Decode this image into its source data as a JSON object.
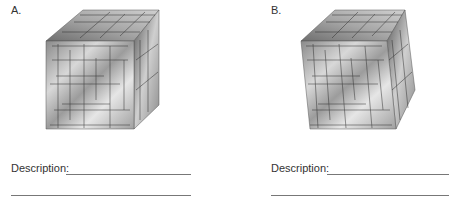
{
  "panels": [
    {
      "id": "A",
      "label": "A.",
      "description_label": "Description:",
      "cube": {
        "variant": "regular",
        "front": [
          [
            46,
            41
          ],
          [
            134,
            41
          ],
          [
            134,
            129
          ],
          [
            46,
            129
          ]
        ],
        "top": [
          [
            46,
            41
          ],
          [
            83,
            10
          ],
          [
            159,
            10
          ],
          [
            134,
            41
          ]
        ],
        "right": [
          [
            134,
            41
          ],
          [
            159,
            10
          ],
          [
            159,
            105
          ],
          [
            134,
            129
          ]
        ]
      }
    },
    {
      "id": "B",
      "label": "B.",
      "description_label": "Description:",
      "cube": {
        "variant": "distorted",
        "front": [
          [
            301,
            41
          ],
          [
            387,
            41
          ],
          [
            396,
            129
          ],
          [
            310,
            129
          ]
        ],
        "top": [
          [
            301,
            41
          ],
          [
            335,
            10
          ],
          [
            405,
            10
          ],
          [
            387,
            41
          ]
        ],
        "right": [
          [
            387,
            41
          ],
          [
            405,
            10
          ],
          [
            415,
            90
          ],
          [
            396,
            129
          ]
        ]
      }
    }
  ],
  "colors": {
    "text": "#333333",
    "underline": "#777777",
    "grid_line": "#2a2a2a"
  }
}
